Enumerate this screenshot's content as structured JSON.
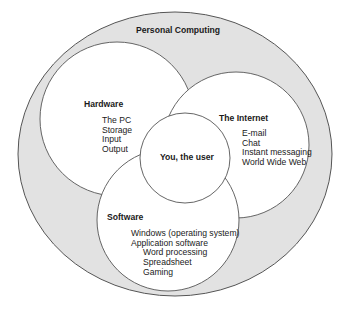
{
  "diagram": {
    "type": "nested-venn",
    "colors": {
      "outer_fill": "#e2e2e2",
      "inner_fill": "#ffffff",
      "stroke": "#555555",
      "text": "#1a1a1a"
    },
    "outer": {
      "title": "Personal Computing"
    },
    "hardware": {
      "title": "Hardware",
      "items": [
        "The PC",
        "Storage",
        "Input",
        "Output"
      ]
    },
    "internet": {
      "title": "The Internet",
      "items": [
        "E-mail",
        "Chat",
        "Instant messaging",
        "World Wide Web"
      ]
    },
    "software": {
      "title": "Software",
      "items": [
        {
          "label": "Windows (operating system)",
          "level": 0
        },
        {
          "label": "Application software",
          "level": 0
        },
        {
          "label": "Word processing",
          "level": 1
        },
        {
          "label": "Spreadsheet",
          "level": 1
        },
        {
          "label": "Gaming",
          "level": 1
        }
      ]
    },
    "center": {
      "title": "You, the user"
    }
  }
}
